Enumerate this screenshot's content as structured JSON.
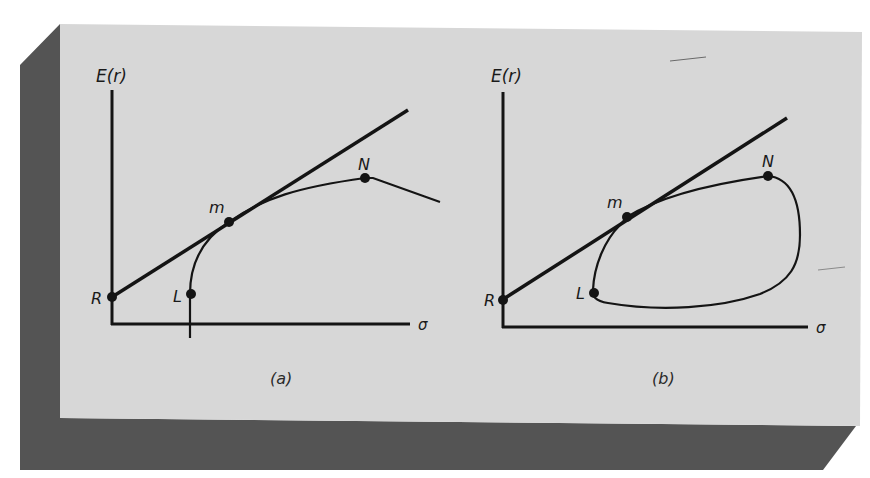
{
  "colors": {
    "face": "#d6d6d6",
    "slab": "#555555",
    "ink": "#141414",
    "background": "#ffffff"
  },
  "panels": [
    {
      "id": "a",
      "caption": "(a)",
      "y_axis_label": "E(r)",
      "x_axis_label": "σ",
      "points": [
        {
          "name": "R",
          "label": "R"
        },
        {
          "name": "L",
          "label": "L"
        },
        {
          "name": "m",
          "label": "m"
        },
        {
          "name": "N",
          "label": "N"
        }
      ],
      "description": "Capital market line from R tangent to efficient frontier at m; frontier rises from L through m to N then declines"
    },
    {
      "id": "b",
      "caption": "(b)",
      "y_axis_label": "E(r)",
      "x_axis_label": "σ",
      "points": [
        {
          "name": "R",
          "label": "R"
        },
        {
          "name": "L",
          "label": "L"
        },
        {
          "name": "m",
          "label": "m"
        },
        {
          "name": "N",
          "label": "N"
        }
      ],
      "description": "Capital market line from R tangent at m to a closed opportunity set passing through L and N"
    }
  ]
}
